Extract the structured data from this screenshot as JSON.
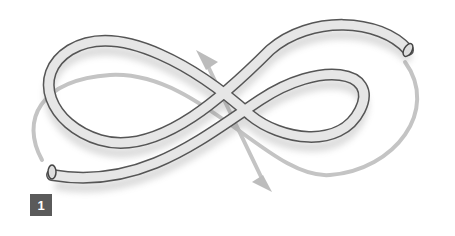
{
  "figure": {
    "step_number": "1",
    "colors": {
      "hose_fill": "#e4e4e4",
      "hose_outline": "#555555",
      "arrow": "#bdbdbd",
      "badge": "#5a5a5a"
    }
  }
}
